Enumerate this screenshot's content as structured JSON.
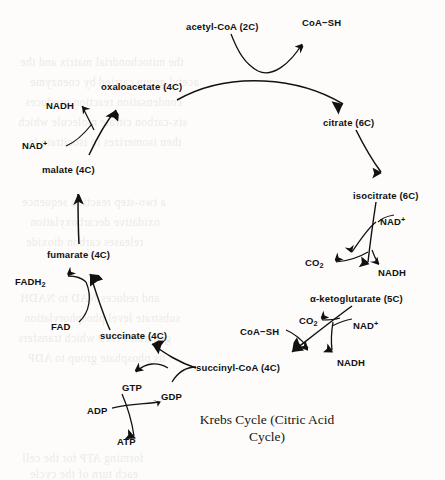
{
  "diagram": {
    "title_line1": "Krebs Cycle (Citric Acid",
    "title_line2": "Cycle)",
    "ink_color": "#111111",
    "background_color": "#fdfcfa",
    "metabolites": [
      {
        "id": "acetyl-coa",
        "label": "acetyl-CoA (2C)",
        "x": 186,
        "y": 22
      },
      {
        "id": "coa-sh-top",
        "label": "CoA−SH",
        "x": 302,
        "y": 18
      },
      {
        "id": "oxaloacetate",
        "label": "oxaloacetate (4C)",
        "x": 101,
        "y": 82
      },
      {
        "id": "citrate",
        "label": "citrate (6C)",
        "x": 323,
        "y": 118
      },
      {
        "id": "nadh-malate",
        "label": "NADH",
        "x": 46,
        "y": 101
      },
      {
        "id": "nad-plus-malate",
        "label": "NAD",
        "sup": "+",
        "x": 22,
        "y": 140
      },
      {
        "id": "malate",
        "label": "malate (4C)",
        "x": 42,
        "y": 165
      },
      {
        "id": "isocitrate",
        "label": "isocitrate (6C)",
        "x": 353,
        "y": 191
      },
      {
        "id": "nad-plus-isocit",
        "label": "NAD",
        "sup": "+",
        "x": 380,
        "y": 216
      },
      {
        "id": "co2-isocit",
        "label": "CO",
        "sub": "2",
        "x": 305,
        "y": 258
      },
      {
        "id": "nadh-isocit",
        "label": "NADH",
        "x": 378,
        "y": 268
      },
      {
        "id": "fumarate",
        "label": "fumarate (4C)",
        "x": 47,
        "y": 250
      },
      {
        "id": "fadh2",
        "label": "FADH",
        "sub": "2",
        "x": 15,
        "y": 277
      },
      {
        "id": "alpha-ketoglutarate",
        "label": "α-ketoglutarate (5C)",
        "x": 310,
        "y": 294
      },
      {
        "id": "co2-akg",
        "label": "CO",
        "sub": "2",
        "x": 299,
        "y": 316
      },
      {
        "id": "nad-plus-akg",
        "label": "NAD",
        "sup": "+",
        "x": 353,
        "y": 320
      },
      {
        "id": "coa-sh-succ",
        "label": "CoA−SH",
        "x": 240,
        "y": 327
      },
      {
        "id": "fad",
        "label": "FAD",
        "x": 51,
        "y": 322
      },
      {
        "id": "succinate",
        "label": "succinate (4C)",
        "x": 100,
        "y": 331
      },
      {
        "id": "nadh-akg",
        "label": "NADH",
        "x": 337,
        "y": 358
      },
      {
        "id": "succinyl-coa",
        "label": "succinyl-CoA (4C)",
        "x": 196,
        "y": 363
      },
      {
        "id": "gtp",
        "label": "GTP",
        "x": 122,
        "y": 383
      },
      {
        "id": "gdp",
        "label": "GDP",
        "x": 161,
        "y": 392
      },
      {
        "id": "adp",
        "label": "ADP",
        "x": 87,
        "y": 406
      },
      {
        "id": "atp",
        "label": "ATP",
        "x": 117,
        "y": 437
      }
    ],
    "bleed_text": [
      {
        "t": "the mitochondrial matrix and the",
        "x": 20,
        "y": 56
      },
      {
        "t": "acetyl group carried by coenzyme",
        "x": 30,
        "y": 76
      },
      {
        "t": "condensation reaction produces",
        "x": 25,
        "y": 96
      },
      {
        "t": "six-carbon citrate molecule which",
        "x": 18,
        "y": 116
      },
      {
        "t": "then isomerizes to isocitrate in",
        "x": 28,
        "y": 136
      },
      {
        "t": "a two-step reaction sequence",
        "x": 22,
        "y": 196
      },
      {
        "t": "oxidative decarboxylation",
        "x": 30,
        "y": 216
      },
      {
        "t": "releases carbon dioxide",
        "x": 26,
        "y": 236
      },
      {
        "t": "and reduces NAD to NADH",
        "x": 20,
        "y": 292
      },
      {
        "t": "substrate level phosphorylation",
        "x": 24,
        "y": 312
      },
      {
        "t": "generates GTP which transfers",
        "x": 18,
        "y": 332
      },
      {
        "t": "its phosphate group to ADP",
        "x": 28,
        "y": 352
      },
      {
        "t": "forming ATP for the cell",
        "x": 22,
        "y": 452
      },
      {
        "t": "each turn of the cycle",
        "x": 30,
        "y": 468
      }
    ]
  }
}
